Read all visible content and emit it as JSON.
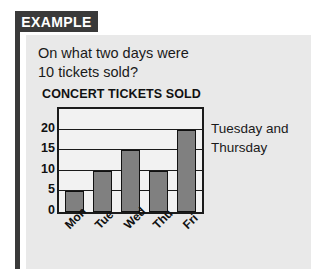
{
  "banner": {
    "label": "EXAMPLE"
  },
  "question": {
    "line1": "On what two days were",
    "line2": "10 tickets sold?"
  },
  "answer": {
    "line1": "Tuesday and",
    "line2": "Thursday"
  },
  "colors": {
    "banner_bg": "#3a3a3a",
    "panel_bg": "#e9e9e9",
    "bar_fill": "#808080",
    "bar_stroke": "#111111",
    "plot_bg": "#f2f2f2",
    "text": "#1a1a1a"
  },
  "chart_data": {
    "type": "bar",
    "title": "CONCERT TICKETS SOLD",
    "categories": [
      "Mon",
      "Tue",
      "Wed",
      "Thu",
      "Fri"
    ],
    "values": [
      5,
      10,
      15,
      10,
      20
    ],
    "xlabel": "",
    "ylabel": "",
    "ylim": [
      0,
      25
    ],
    "yticks": [
      0,
      5,
      10,
      15,
      20
    ],
    "ytick_labels": [
      "0",
      "5",
      "10",
      "15",
      "20"
    ],
    "grid": true,
    "legend": false,
    "xtick_rotation": -45
  }
}
